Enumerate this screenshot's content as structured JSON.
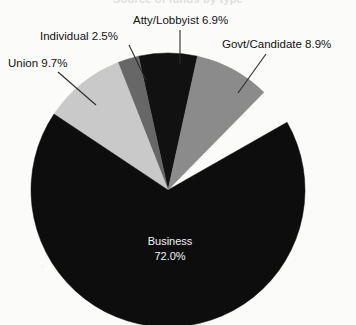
{
  "chart_data": {
    "type": "pie",
    "title": "",
    "subtitle": "",
    "xlabel": "",
    "ylabel": "",
    "legend_position": "none",
    "grid": false,
    "labels_inline": true,
    "total_percent": 100.0,
    "categories": [
      "Business",
      "Union",
      "Govt/Candidate",
      "Atty/Lobbyist",
      "Individual"
    ],
    "values": [
      72.0,
      9.7,
      8.9,
      6.9,
      2.5
    ],
    "slices": [
      {
        "name": "Atty/Lobbyist",
        "value": 6.9,
        "label": "Atty/Lobbyist 6.9%",
        "color": "#111111",
        "start_angle": -12.42,
        "end_angle": 12.42,
        "label_placement": "outside-top",
        "has_leader_line": true
      },
      {
        "name": "Individual",
        "value": 2.5,
        "label": "Individual 2.5%",
        "color": "#676767",
        "start_angle": -21.42,
        "end_angle": -12.42,
        "label_placement": "outside-upper-left",
        "has_leader_line": true
      },
      {
        "name": "Union",
        "value": 9.7,
        "label": "Union 9.7%",
        "color": "#c9c9c9",
        "start_angle": -56.34,
        "end_angle": -21.42,
        "label_placement": "outside-left",
        "has_leader_line": true
      },
      {
        "name": "Business",
        "value": 72.0,
        "label": "Business",
        "sublabel": "72.0%",
        "color": "#0d0d0d",
        "start_angle": -299.64,
        "end_angle": -56.34,
        "label_placement": "inside-center-bottom",
        "has_leader_line": false
      },
      {
        "name": "Govt/Candidate",
        "value": 8.9,
        "label": "Govt/Candidate 8.9%",
        "color": "#8b8b8b",
        "start_angle": 12.42,
        "end_angle": 44.46,
        "label_placement": "outside-upper-right",
        "has_leader_line": true
      }
    ]
  },
  "labels": {
    "union": "Union 9.7%",
    "individual": "Individual 2.5%",
    "atty": "Atty/Lobbyist 6.9%",
    "govt": "Govt/Candidate 8.9%",
    "business_name": "Business",
    "business_value": "72.0%"
  },
  "title": {
    "text": "Source of funds by type"
  },
  "colors": {
    "background": "#fbfbfa",
    "business": "#0d0d0d",
    "union": "#c9c9c9",
    "govt": "#8b8b8b",
    "atty": "#111111",
    "individual": "#676767",
    "label_text": "#111111",
    "inside_label_text": "#f2f2f2",
    "leader_line": "#2a2a2a"
  },
  "geometry": {
    "center_x": 168,
    "center_y": 190,
    "radius": 137
  }
}
